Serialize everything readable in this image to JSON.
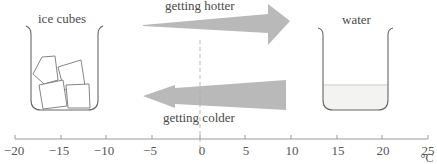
{
  "labels": {
    "left_beaker": "ice cubes",
    "right_beaker": "water",
    "top_arrow": "getting hotter",
    "bottom_arrow": "getting colder",
    "unit": "°C"
  },
  "axis": {
    "ticks": [
      "−20",
      "−15",
      "−10",
      "−5",
      "0",
      "5",
      "10",
      "15",
      "20",
      "25"
    ],
    "values": [
      -20,
      -15,
      -10,
      -5,
      0,
      5,
      10,
      15,
      20,
      25
    ],
    "min": -20,
    "max": 25,
    "step": 5
  },
  "colors": {
    "arrow_fill": "#b8b8b8",
    "line": "#8a8a8a",
    "water_fill": "#f2f2f0",
    "text": "#4a4a4a"
  }
}
